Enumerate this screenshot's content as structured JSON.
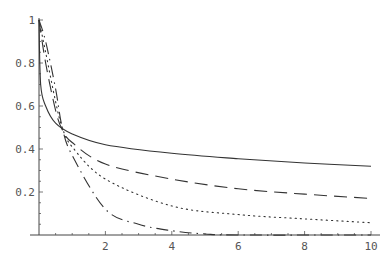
{
  "chart_data": {
    "type": "line",
    "title": "",
    "xlabel": "",
    "ylabel": "",
    "xlim": [
      0,
      10
    ],
    "ylim": [
      0,
      1
    ],
    "grid": false,
    "x_ticks": [
      2,
      4,
      6,
      8,
      10
    ],
    "x_tick_labels": [
      "2",
      "4",
      "6",
      "8",
      "10"
    ],
    "y_ticks": [
      0.2,
      0.4,
      0.6,
      0.8,
      1
    ],
    "y_tick_labels": [
      "0.2",
      "0.4",
      "0.6",
      "0.8",
      "1"
    ],
    "series": [
      {
        "name": "solid",
        "style": "solid",
        "x": [
          0,
          0.05,
          0.2,
          0.5,
          1,
          2,
          4,
          6,
          8,
          10
        ],
        "y": [
          1,
          0.7,
          0.6,
          0.52,
          0.47,
          0.42,
          0.38,
          0.355,
          0.335,
          0.32
        ]
      },
      {
        "name": "dashed",
        "style": "dashed",
        "x": [
          0,
          0.2,
          0.5,
          0.7,
          1,
          2,
          4,
          6,
          8,
          10
        ],
        "y": [
          1,
          0.8,
          0.58,
          0.49,
          0.43,
          0.33,
          0.26,
          0.215,
          0.19,
          0.17
        ]
      },
      {
        "name": "dotted",
        "style": "dotted",
        "x": [
          0,
          0.2,
          0.5,
          0.7,
          1,
          2,
          4,
          6,
          8,
          10
        ],
        "y": [
          1,
          0.85,
          0.62,
          0.5,
          0.41,
          0.26,
          0.135,
          0.095,
          0.075,
          0.057
        ]
      },
      {
        "name": "dash-dot",
        "style": "dashdot",
        "x": [
          0,
          0.2,
          0.5,
          0.7,
          1,
          2,
          3,
          4,
          5,
          6,
          10
        ],
        "y": [
          1,
          0.9,
          0.68,
          0.5,
          0.37,
          0.12,
          0.05,
          0.02,
          0.005,
          0,
          0
        ]
      }
    ]
  }
}
